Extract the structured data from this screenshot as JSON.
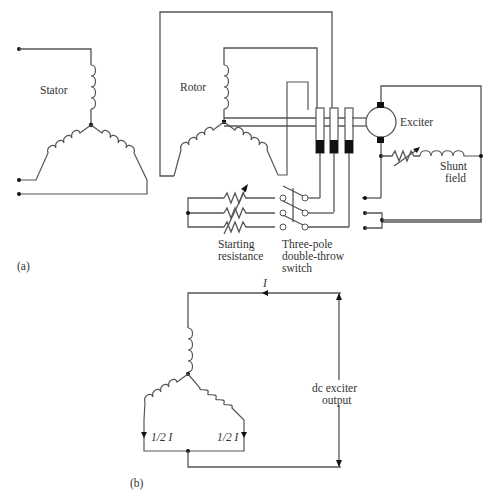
{
  "figure_a": {
    "panel_label": "(a)",
    "stator_label": "Stator",
    "rotor_label": "Rotor",
    "exciter_label": "Exciter",
    "shunt_field_label_1": "Shunt",
    "shunt_field_label_2": "field",
    "starting_resistance_label_1": "Starting",
    "starting_resistance_label_2": "resistance",
    "switch_label_1": "Three-pole",
    "switch_label_2": "double-throw",
    "switch_label_3": "switch"
  },
  "figure_b": {
    "panel_label": "(b)",
    "current_label": "I",
    "half_current_left": "1/2 I",
    "half_current_right": "1/2 I",
    "output_label_1": "dc exciter",
    "output_label_2": "output"
  }
}
